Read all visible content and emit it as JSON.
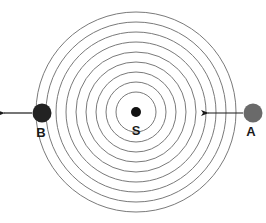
{
  "diagram": {
    "type": "concentric-wavefronts",
    "center": {
      "x": 136,
      "y": 112
    },
    "ring_radii": [
      20,
      30,
      40,
      50,
      60,
      70,
      80,
      90,
      100
    ],
    "ring_color": "#7a7a7a",
    "source": {
      "label": "S",
      "x": 136,
      "y": 112,
      "r": 5,
      "color": "#111111"
    },
    "objects": [
      {
        "label": "B",
        "x": 42,
        "y": 113,
        "r": 9.5,
        "color": "#222222",
        "arrow": {
          "direction": "left",
          "x1": 32,
          "x2": 4,
          "y": 113
        },
        "label_pos": {
          "x": 41,
          "y": 137
        }
      },
      {
        "label": "A",
        "x": 253,
        "y": 113,
        "r": 9.5,
        "color": "#6a6a6a",
        "arrow": {
          "direction": "left",
          "x1": 243,
          "x2": 208,
          "y": 113
        },
        "label_pos": {
          "x": 251,
          "y": 136
        }
      }
    ]
  }
}
